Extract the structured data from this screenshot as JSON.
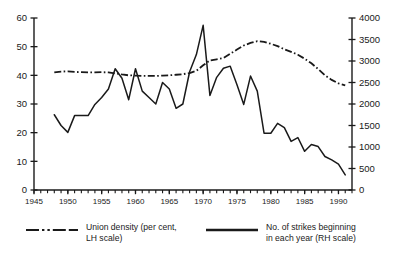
{
  "chart_data": {
    "type": "line",
    "title": "",
    "subtitle": "",
    "xlabel": "",
    "ylabel": "",
    "xlim": [
      1945,
      1992
    ],
    "x_ticks_major": [
      1945,
      1950,
      1955,
      1960,
      1965,
      1970,
      1975,
      1980,
      1985,
      1990
    ],
    "x_tick_minor_step": 1,
    "grid": false,
    "legend_position": "below",
    "axes": [
      {
        "id": "left",
        "label": "Union density (per cent, LH scale)",
        "ylim": [
          0,
          60
        ],
        "ticks": [
          0,
          10,
          20,
          30,
          40,
          50,
          60
        ],
        "tick_labels": [
          "0",
          "10",
          "20",
          "30",
          "40",
          "50",
          "60"
        ]
      },
      {
        "id": "right",
        "label": "No. of strikes beginning in each year (RH scale)",
        "ylim": [
          0,
          4000
        ],
        "ticks": [
          0,
          500,
          1000,
          1500,
          2000,
          2500,
          3000,
          3500,
          4000
        ],
        "tick_labels": [
          "0",
          "500",
          "1000",
          "1500",
          "2000",
          "2500",
          "3000",
          "3500",
          "4000"
        ]
      }
    ],
    "series": [
      {
        "name": "Union density (per cent, LH scale)",
        "axis": "left",
        "style": "dash-dot",
        "color": "#1a1a1a",
        "unit": "per cent",
        "x": [
          1948,
          1949,
          1950,
          1951,
          1952,
          1953,
          1954,
          1955,
          1956,
          1957,
          1958,
          1959,
          1960,
          1961,
          1962,
          1963,
          1964,
          1965,
          1966,
          1967,
          1968,
          1969,
          1970,
          1971,
          1972,
          1973,
          1974,
          1975,
          1976,
          1977,
          1978,
          1979,
          1980,
          1981,
          1982,
          1983,
          1984,
          1985,
          1986,
          1987,
          1988,
          1989,
          1990,
          1991
        ],
        "y": [
          41.0,
          41.3,
          41.4,
          41.2,
          41.1,
          41.0,
          41.0,
          41.1,
          41.0,
          40.7,
          40.3,
          40.0,
          39.9,
          39.8,
          39.8,
          39.8,
          39.9,
          40.0,
          40.2,
          40.4,
          40.8,
          41.6,
          43.5,
          45.2,
          45.6,
          46.0,
          47.5,
          49.0,
          50.4,
          51.3,
          51.9,
          51.7,
          51.0,
          50.2,
          49.1,
          48.2,
          47.2,
          45.8,
          44.2,
          42.2,
          40.0,
          38.4,
          37.2,
          36.5
        ]
      },
      {
        "name": "No. of strikes beginning in each year (RH scale)",
        "axis": "right",
        "style": "solid",
        "color": "#1a1a1a",
        "unit": "strikes",
        "x": [
          1948,
          1949,
          1950,
          1951,
          1952,
          1953,
          1954,
          1955,
          1956,
          1957,
          1958,
          1959,
          1960,
          1961,
          1962,
          1963,
          1964,
          1965,
          1966,
          1967,
          1968,
          1969,
          1970,
          1971,
          1972,
          1973,
          1974,
          1975,
          1976,
          1977,
          1978,
          1979,
          1980,
          1981,
          1982,
          1983,
          1984,
          1985,
          1986,
          1987,
          1988,
          1989,
          1990,
          1991
        ],
        "y": [
          1750,
          1500,
          1340,
          1730,
          1730,
          1730,
          1990,
          2150,
          2350,
          2820,
          2600,
          2100,
          2820,
          2300,
          2150,
          2000,
          2500,
          2350,
          1900,
          2000,
          2750,
          3150,
          3830,
          2200,
          2620,
          2830,
          2880,
          2450,
          1990,
          2650,
          2300,
          1320,
          1320,
          1550,
          1450,
          1130,
          1220,
          900,
          1060,
          1010,
          780,
          700,
          600,
          350
        ]
      }
    ]
  },
  "legend": {
    "items": [
      {
        "label": "Union density (per cent,\nLH scale)",
        "style": "dash-dot"
      },
      {
        "label": "No. of strikes beginning\nin each year (RH scale)",
        "style": "solid"
      }
    ]
  },
  "colors": {
    "ink": "#1a1a1a",
    "background": "#ffffff"
  }
}
